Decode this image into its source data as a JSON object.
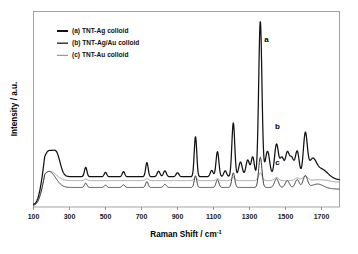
{
  "figure": {
    "background": "#ffffff",
    "frame_color": "#9a9a9a"
  },
  "chart_data": {
    "type": "line",
    "title": "",
    "xlabel_text": "Raman Shift / cm",
    "xlabel_sup": "-1",
    "ylabel": "Intensity / a.u.",
    "xlim": [
      100,
      1800
    ],
    "ylim": [
      0,
      1.0
    ],
    "xticks": [
      100,
      300,
      500,
      700,
      900,
      1100,
      1300,
      1500,
      1700
    ],
    "xticklabels": [
      "100",
      "300",
      "500",
      "700",
      "900",
      "1100",
      "1300",
      "1500",
      "1700"
    ],
    "yticks": [],
    "yticklabels": [],
    "grid": false,
    "legend_position": "upper-left",
    "series": [
      {
        "name": "(a) TNT-Ag colloid",
        "key": "a",
        "color": "#121212",
        "width": 1.25,
        "offset": 0.155,
        "curve_label": "a",
        "curve_label_x": 1395,
        "curve_label_y": 0.845,
        "peaks": [
          {
            "x": 170,
            "h": 0.075,
            "w": 26
          },
          {
            "x": 205,
            "h": 0.085,
            "w": 30
          },
          {
            "x": 232,
            "h": 0.06,
            "w": 18
          },
          {
            "x": 390,
            "h": 0.048,
            "w": 7
          },
          {
            "x": 500,
            "h": 0.022,
            "w": 7
          },
          {
            "x": 600,
            "h": 0.026,
            "w": 7
          },
          {
            "x": 730,
            "h": 0.072,
            "w": 7
          },
          {
            "x": 795,
            "h": 0.028,
            "w": 8
          },
          {
            "x": 830,
            "h": 0.03,
            "w": 8
          },
          {
            "x": 900,
            "h": 0.02,
            "w": 8
          },
          {
            "x": 1000,
            "h": 0.205,
            "w": 7
          },
          {
            "x": 1090,
            "h": 0.032,
            "w": 8
          },
          {
            "x": 1122,
            "h": 0.128,
            "w": 8
          },
          {
            "x": 1165,
            "h": 0.03,
            "w": 8
          },
          {
            "x": 1210,
            "h": 0.275,
            "w": 8
          },
          {
            "x": 1250,
            "h": 0.075,
            "w": 10
          },
          {
            "x": 1290,
            "h": 0.085,
            "w": 10
          },
          {
            "x": 1318,
            "h": 0.1,
            "w": 9
          },
          {
            "x": 1360,
            "h": 0.795,
            "w": 9
          },
          {
            "x": 1400,
            "h": 0.13,
            "w": 12
          },
          {
            "x": 1450,
            "h": 0.165,
            "w": 11
          },
          {
            "x": 1480,
            "h": 0.095,
            "w": 11
          },
          {
            "x": 1510,
            "h": 0.12,
            "w": 11
          },
          {
            "x": 1535,
            "h": 0.09,
            "w": 11
          },
          {
            "x": 1565,
            "h": 0.13,
            "w": 11
          },
          {
            "x": 1610,
            "h": 0.215,
            "w": 11
          },
          {
            "x": 1650,
            "h": 0.08,
            "w": 20
          },
          {
            "x": 1700,
            "h": 0.045,
            "w": 35
          }
        ],
        "baseline_notes": "steep rise from 100 to 160; flat thereafter"
      },
      {
        "name": "(b) TNT-Ag/Au colloid",
        "key": "b",
        "color": "#3a3a3a",
        "width": 1.0,
        "offset": 0.1,
        "curve_label": "b",
        "curve_label_x": 1455,
        "curve_label_y": 0.4,
        "peaks": [
          {
            "x": 170,
            "h": 0.048,
            "w": 26
          },
          {
            "x": 205,
            "h": 0.052,
            "w": 30
          },
          {
            "x": 390,
            "h": 0.022,
            "w": 7
          },
          {
            "x": 500,
            "h": 0.012,
            "w": 7
          },
          {
            "x": 600,
            "h": 0.014,
            "w": 7
          },
          {
            "x": 730,
            "h": 0.03,
            "w": 7
          },
          {
            "x": 830,
            "h": 0.016,
            "w": 8
          },
          {
            "x": 1000,
            "h": 0.06,
            "w": 7
          },
          {
            "x": 1122,
            "h": 0.04,
            "w": 8
          },
          {
            "x": 1210,
            "h": 0.075,
            "w": 8
          },
          {
            "x": 1360,
            "h": 0.155,
            "w": 9
          },
          {
            "x": 1450,
            "h": 0.045,
            "w": 11
          },
          {
            "x": 1510,
            "h": 0.035,
            "w": 11
          },
          {
            "x": 1565,
            "h": 0.04,
            "w": 11
          },
          {
            "x": 1610,
            "h": 0.06,
            "w": 12
          },
          {
            "x": 1680,
            "h": 0.02,
            "w": 30
          }
        ],
        "baseline_notes": "low flat baseline, slight dip after 1650"
      },
      {
        "name": "(c) TNT-Au colloid",
        "key": "c",
        "color": "#9b9b9b",
        "width": 1.0,
        "offset": 0.135,
        "curve_label": "c",
        "curve_label_x": 1455,
        "curve_label_y": 0.215,
        "peaks": [
          {
            "x": 175,
            "h": 0.03,
            "w": 30
          },
          {
            "x": 210,
            "h": 0.026,
            "w": 30
          },
          {
            "x": 390,
            "h": 0.008,
            "w": 8
          },
          {
            "x": 730,
            "h": 0.01,
            "w": 8
          },
          {
            "x": 1000,
            "h": 0.016,
            "w": 8
          },
          {
            "x": 1122,
            "h": 0.01,
            "w": 8
          },
          {
            "x": 1210,
            "h": 0.018,
            "w": 9
          },
          {
            "x": 1360,
            "h": 0.04,
            "w": 10
          },
          {
            "x": 1450,
            "h": 0.016,
            "w": 12
          },
          {
            "x": 1565,
            "h": 0.014,
            "w": 12
          },
          {
            "x": 1610,
            "h": 0.022,
            "w": 14
          },
          {
            "x": 1700,
            "h": 0.008,
            "w": 40
          }
        ],
        "baseline_notes": "smooth gently sloping baseline, weakest signal"
      }
    ],
    "legend_entries": [
      {
        "label": "(a)  TNT-Ag colloid",
        "color": "#121212",
        "width": 2.0
      },
      {
        "label": "(b)  TNT-Ag/Au colloid",
        "color": "#3a3a3a",
        "width": 1.5
      },
      {
        "label": "(c)  TNT-Au colloid",
        "color": "#9b9b9b",
        "width": 1.2
      }
    ]
  }
}
